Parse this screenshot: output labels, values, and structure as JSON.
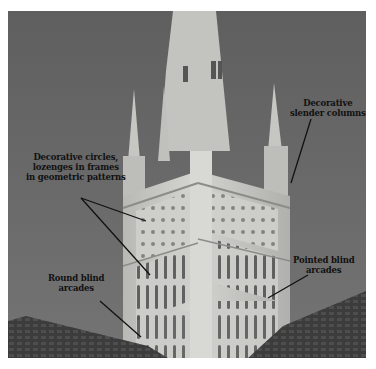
{
  "figure": {
    "colors": {
      "sky": "#6b6b6b",
      "stone": "#c9c9c4",
      "stone_shadow": "#9a9a96",
      "roof": "#3a3a3a",
      "annotation_line": "#111111",
      "frame": "#ffffff"
    }
  },
  "annotations": [
    {
      "id": "circles",
      "lines": [
        "Decorative circles,",
        "lozenges in frames",
        "in geometric patterns"
      ]
    },
    {
      "id": "columns",
      "lines": [
        "Decorative",
        "slender columns"
      ]
    },
    {
      "id": "pointed",
      "lines": [
        "Pointed blind",
        "arcades"
      ]
    },
    {
      "id": "round",
      "lines": [
        "Round blind",
        "arcades"
      ]
    }
  ]
}
